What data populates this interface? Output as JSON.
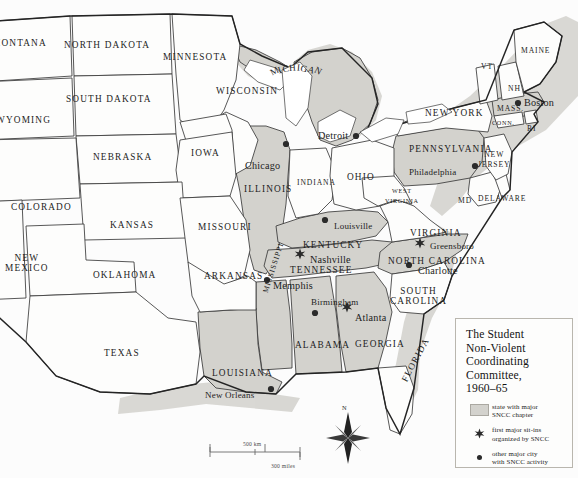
{
  "map": {
    "title": "The Student Non-Violent Coordinating Committee, 1960–65",
    "projection_note": "United States, eastern two-thirds",
    "colors": {
      "shaded_state_fill": "#d3d2cd",
      "plain_state_fill": "#fdfdfc",
      "border": "#3a3a3a",
      "ocean": "#ffffff",
      "coastal_shadow": "#cfcfcb",
      "text": "#1d1d1d"
    }
  },
  "legend": {
    "title_lines": [
      "The Student",
      "Non-Violent",
      "Coordinating",
      "Committee,",
      "1960–65"
    ],
    "items": [
      {
        "key": "swatch",
        "icon": "shaded-square-icon",
        "text_lines": [
          "state with major",
          "SNCC chapter"
        ]
      },
      {
        "key": "star",
        "icon": "star-icon",
        "text_lines": [
          "first major sit-ins",
          "organized by SNCC"
        ]
      },
      {
        "key": "dot",
        "icon": "dot-icon",
        "text_lines": [
          "other major city",
          "with SNCC activity"
        ]
      }
    ]
  },
  "scale": {
    "km_label": "500 km",
    "miles_label": "300 miles"
  },
  "compass": {
    "north_label": "N"
  },
  "states": [
    {
      "name": "MONTANA",
      "shaded": false,
      "x": -8,
      "y": 38,
      "size": "norm",
      "rot": 0
    },
    {
      "name": "NORTH DAKOTA",
      "shaded": false,
      "x": 64,
      "y": 40,
      "size": "norm",
      "rot": 0
    },
    {
      "name": "MINNESOTA",
      "shaded": false,
      "x": 163,
      "y": 52,
      "size": "norm",
      "rot": 0
    },
    {
      "name": "SOUTH DAKOTA",
      "shaded": false,
      "x": 66,
      "y": 94,
      "size": "norm",
      "rot": 0
    },
    {
      "name": "WYOMING",
      "shaded": false,
      "x": -4,
      "y": 115,
      "size": "norm",
      "rot": 0
    },
    {
      "name": "NEBRASKA",
      "shaded": false,
      "x": 93,
      "y": 152,
      "size": "norm",
      "rot": 0
    },
    {
      "name": "IOWA",
      "shaded": false,
      "x": 191,
      "y": 148,
      "size": "norm",
      "rot": 0
    },
    {
      "name": "WISCONSIN",
      "shaded": false,
      "x": 216,
      "y": 86,
      "size": "norm",
      "rot": 0
    },
    {
      "name": "MICHIGAN",
      "shaded": true,
      "x": 268,
      "y": 62,
      "size": "norm",
      "rot": 0,
      "arched": true
    },
    {
      "name": "COLORADO",
      "shaded": false,
      "x": 11,
      "y": 202,
      "size": "norm",
      "rot": 0
    },
    {
      "name": "KANSAS",
      "shaded": false,
      "x": 110,
      "y": 220,
      "size": "norm",
      "rot": 0
    },
    {
      "name": "MISSOURI",
      "shaded": false,
      "x": 198,
      "y": 222,
      "size": "norm",
      "rot": 0
    },
    {
      "name": "ILLINOIS",
      "shaded": true,
      "x": 244,
      "y": 184,
      "size": "norm",
      "rot": 0
    },
    {
      "name": "INDIANA",
      "shaded": false,
      "x": 297,
      "y": 178,
      "size": "sm",
      "rot": 0
    },
    {
      "name": "OHIO",
      "shaded": false,
      "x": 347,
      "y": 172,
      "size": "norm",
      "rot": 0
    },
    {
      "name": "NEW MEXICO",
      "shaded": false,
      "x": 5,
      "y": 253,
      "size": "norm",
      "rot": 0,
      "two_line": true
    },
    {
      "name": "OKLAHOMA",
      "shaded": false,
      "x": 93,
      "y": 270,
      "size": "norm",
      "rot": 0
    },
    {
      "name": "ARKANSAS",
      "shaded": false,
      "x": 204,
      "y": 271,
      "size": "norm",
      "rot": 0
    },
    {
      "name": "TEXAS",
      "shaded": false,
      "x": 104,
      "y": 348,
      "size": "norm",
      "rot": 0
    },
    {
      "name": "LOUISIANA",
      "shaded": true,
      "x": 212,
      "y": 368,
      "size": "norm",
      "rot": 0
    },
    {
      "name": "MISSISSIPPI",
      "shaded": true,
      "x": 265,
      "y": 288,
      "size": "sm",
      "rot": 72
    },
    {
      "name": "ALABAMA",
      "shaded": true,
      "x": 295,
      "y": 340,
      "size": "norm",
      "rot": 0
    },
    {
      "name": "TENNESSEE",
      "shaded": true,
      "x": 290,
      "y": 265,
      "size": "norm",
      "rot": 0
    },
    {
      "name": "KENTUCKY",
      "shaded": true,
      "x": 303,
      "y": 240,
      "size": "norm",
      "rot": 0
    },
    {
      "name": "GEORGIA",
      "shaded": true,
      "x": 355,
      "y": 339,
      "size": "norm",
      "rot": 0
    },
    {
      "name": "SOUTH CAROLINA",
      "shaded": false,
      "x": 390,
      "y": 286,
      "size": "norm",
      "rot": 0,
      "two_line": true
    },
    {
      "name": "NORTH CAROLINA",
      "shaded": true,
      "x": 388,
      "y": 256,
      "size": "norm",
      "rot": 0
    },
    {
      "name": "VIRGINIA",
      "shaded": false,
      "x": 410,
      "y": 228,
      "size": "norm",
      "rot": 0
    },
    {
      "name": "WEST VIRGINIA",
      "shaded": false,
      "x": 385,
      "y": 186,
      "size": "xs",
      "rot": 0,
      "two_line": true
    },
    {
      "name": "MD",
      "shaded": false,
      "x": 458,
      "y": 196,
      "size": "sm",
      "rot": 0
    },
    {
      "name": "DELAWARE",
      "shaded": false,
      "x": 478,
      "y": 194,
      "size": "sm",
      "rot": 0
    },
    {
      "name": "PENNSYLVANIA",
      "shaded": true,
      "x": 409,
      "y": 144,
      "size": "norm",
      "rot": 0
    },
    {
      "name": "NEW JERSEY",
      "shaded": false,
      "x": 478,
      "y": 150,
      "size": "sm",
      "rot": 0,
      "two_line": true
    },
    {
      "name": "NEW YORK",
      "shaded": false,
      "x": 425,
      "y": 108,
      "size": "norm",
      "rot": 0
    },
    {
      "name": "VT",
      "shaded": false,
      "x": 481,
      "y": 62,
      "size": "sm",
      "rot": 0
    },
    {
      "name": "NH",
      "shaded": false,
      "x": 508,
      "y": 84,
      "size": "sm",
      "rot": 0
    },
    {
      "name": "MAINE",
      "shaded": false,
      "x": 521,
      "y": 46,
      "size": "sm",
      "rot": 0
    },
    {
      "name": "MASS.",
      "shaded": true,
      "x": 497,
      "y": 104,
      "size": "sm",
      "rot": 0
    },
    {
      "name": "CONN.",
      "shaded": false,
      "x": 492,
      "y": 119,
      "size": "xs",
      "rot": 0
    },
    {
      "name": "RI",
      "shaded": false,
      "x": 527,
      "y": 124,
      "size": "sm",
      "rot": 0
    },
    {
      "name": "FLORIDA",
      "shaded": false,
      "x": 404,
      "y": 376,
      "size": "norm",
      "rot": 62
    }
  ],
  "cities": [
    {
      "name": "Boston",
      "marker": "dot",
      "label_x": 524,
      "label_y": 97,
      "dot_x": 518,
      "dot_y": 103,
      "anchor": "left"
    },
    {
      "name": "Detroit",
      "marker": "dot",
      "label_x": 318,
      "label_y": 130,
      "dot_x": 356,
      "dot_y": 136,
      "anchor": "left"
    },
    {
      "name": "Chicago",
      "marker": "dot",
      "label_x": 245,
      "label_y": 160,
      "dot_x": 286,
      "dot_y": 144,
      "anchor": "left"
    },
    {
      "name": "Philadelphia",
      "marker": "dot",
      "label_x": 409,
      "label_y": 167,
      "dot_x": 475,
      "dot_y": 166,
      "anchor": "left"
    },
    {
      "name": "Louisville",
      "marker": "dot",
      "label_x": 334,
      "label_y": 221,
      "dot_x": 325,
      "dot_y": 220,
      "anchor": "left"
    },
    {
      "name": "Greensboro",
      "marker": "star",
      "label_x": 430,
      "label_y": 241,
      "dot_x": 420,
      "dot_y": 243,
      "anchor": "left"
    },
    {
      "name": "Charlotte",
      "marker": "dot",
      "label_x": 418,
      "label_y": 265,
      "dot_x": 409,
      "dot_y": 265,
      "anchor": "left"
    },
    {
      "name": "Nashville",
      "marker": "star",
      "label_x": 310,
      "label_y": 254,
      "dot_x": 300,
      "dot_y": 254,
      "anchor": "left"
    },
    {
      "name": "Memphis",
      "marker": "dot",
      "label_x": 273,
      "label_y": 280,
      "dot_x": 267,
      "dot_y": 280,
      "anchor": "left"
    },
    {
      "name": "Birmingham",
      "marker": "dot",
      "label_x": 311,
      "label_y": 297,
      "dot_x": 315,
      "dot_y": 313,
      "anchor": "left"
    },
    {
      "name": "Atlanta",
      "marker": "star",
      "label_x": 355,
      "label_y": 312,
      "dot_x": 347,
      "dot_y": 307,
      "anchor": "left"
    },
    {
      "name": "New Orleans",
      "marker": "dot",
      "label_x": 205,
      "label_y": 390,
      "dot_x": 271,
      "dot_y": 389,
      "anchor": "left"
    }
  ]
}
